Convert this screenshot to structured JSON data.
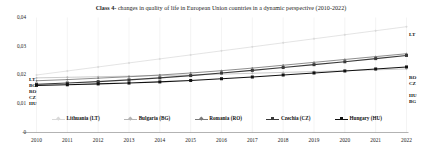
{
  "chart_data": {
    "type": "line",
    "title_bold": "Class 4-",
    "title_rest": " changes in quality of life in European Union countries in a dynamic perspective (2010-2022)",
    "title": "Class 4- changes in quality of life in European Union countries in a dynamic perspective (2010-2022)",
    "xlabel": "",
    "ylabel": "",
    "categories": [
      "2010",
      "2011",
      "2012",
      "2013",
      "2014",
      "2015",
      "2016",
      "2017",
      "2018",
      "2019",
      "2020",
      "2021",
      "2022"
    ],
    "x": [
      2010,
      2011,
      2012,
      2013,
      2014,
      2015,
      2016,
      2017,
      2018,
      2019,
      2020,
      2021,
      2022
    ],
    "ylim": [
      0,
      0.04
    ],
    "yticks": [
      0,
      0.01,
      0.02,
      0.03,
      0.04
    ],
    "ytick_labels": [
      "0",
      "0,01",
      "0,02",
      "0,03",
      "0,04"
    ],
    "grid": "vertical-only",
    "legend_position": "bottom",
    "series": [
      {
        "name": "Lithuania (LT)",
        "code": "LT",
        "color": "#d9d9d9",
        "marker": "diamond",
        "start_label": "LT",
        "end_label": "LT",
        "values": [
          0.02,
          0.0214,
          0.0228,
          0.0242,
          0.0256,
          0.027,
          0.0284,
          0.0298,
          0.0312,
          0.0326,
          0.034,
          0.0354,
          0.0368
        ]
      },
      {
        "name": "Bulgaria (BG)",
        "code": "BG",
        "color": "#b5b5b5",
        "marker": "diamond",
        "start_label": "BG",
        "end_label": "BG",
        "values": [
          0.019,
          0.0192,
          0.0194,
          0.0196,
          0.0198,
          0.02,
          0.0203,
          0.0206,
          0.0209,
          0.0212,
          0.0215,
          0.0218,
          0.0221
        ]
      },
      {
        "name": "Romania (RO)",
        "code": "RO",
        "color": "#7a7a7a",
        "marker": "diamond",
        "start_label": "RO",
        "end_label": "RO",
        "values": [
          0.018,
          0.0184,
          0.0189,
          0.0194,
          0.02,
          0.0207,
          0.0215,
          0.0224,
          0.0234,
          0.0244,
          0.0254,
          0.0264,
          0.0274
        ]
      },
      {
        "name": "Czechia (CZ)",
        "code": "CZ",
        "color": "#3a3a3a",
        "marker": "square",
        "start_label": "CZ",
        "end_label": "CZ",
        "values": [
          0.0168,
          0.0172,
          0.0177,
          0.0183,
          0.019,
          0.0198,
          0.0207,
          0.0216,
          0.0226,
          0.0236,
          0.0246,
          0.0257,
          0.0268
        ]
      },
      {
        "name": "Hungary (HU)",
        "code": "HU",
        "color": "#111111",
        "marker": "square",
        "start_label": "HU",
        "end_label": "HU",
        "values": [
          0.0164,
          0.0166,
          0.0169,
          0.0172,
          0.0176,
          0.0181,
          0.0187,
          0.0193,
          0.02,
          0.0207,
          0.0214,
          0.0221,
          0.0228
        ]
      }
    ]
  }
}
